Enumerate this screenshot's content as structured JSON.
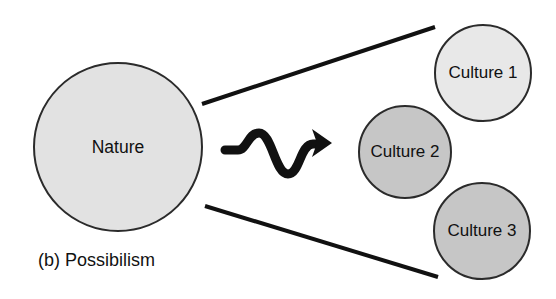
{
  "figure": {
    "caption": "(b) Possibilism",
    "background_color": "#ffffff"
  },
  "nodes": {
    "nature": {
      "label": "Nature",
      "cx": 118,
      "cy": 147,
      "r": 84,
      "fill": "#e2e2e2",
      "stroke": "#2b2b2b"
    },
    "culture1": {
      "label": "Culture 1",
      "cx": 483,
      "cy": 73,
      "r": 48,
      "fill": "#e8e8e8",
      "stroke": "#2b2b2b"
    },
    "culture2": {
      "label": "Culture 2",
      "cx": 405,
      "cy": 152,
      "r": 46,
      "fill": "#c6c6c6",
      "stroke": "#2b2b2b"
    },
    "culture3": {
      "label": "Culture 3",
      "cx": 482,
      "cy": 231,
      "r": 48,
      "fill": "#c6c6c6",
      "stroke": "#2b2b2b"
    }
  },
  "connectors": {
    "upper_line": {
      "name": "upper-divergence-line",
      "x1": 202,
      "y1": 104,
      "x2": 435,
      "y2": 27,
      "stroke": "#111111",
      "width": 4
    },
    "lower_line": {
      "name": "lower-divergence-line",
      "x1": 205,
      "y1": 206,
      "x2": 438,
      "y2": 277,
      "stroke": "#111111",
      "width": 4
    },
    "wavy_arrow": {
      "name": "wavy-influence-arrow",
      "path": "M 225 150 L 238 150 C 247 150 248 133 259 133 C 272 133 275 174 288 174 C 300 174 300 144 313 144 L 318 144",
      "arrow_tip_x": 332,
      "arrow_tip_y": 143,
      "stroke": "#111111",
      "width": 9
    }
  }
}
